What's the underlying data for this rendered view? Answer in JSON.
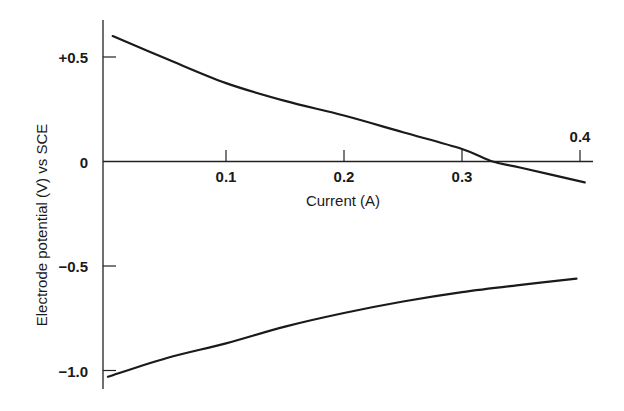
{
  "chart_data": {
    "type": "line",
    "title": "",
    "xlabel": "Current (A)",
    "ylabel": "Electrode potential (V) vs SCE",
    "xlim": [
      0,
      0.41
    ],
    "ylim": [
      -1.05,
      0.62
    ],
    "grid": false,
    "legend": null,
    "x_ticks": [
      {
        "value": 0.1,
        "label": "0.1"
      },
      {
        "value": 0.2,
        "label": "0.2"
      },
      {
        "value": 0.3,
        "label": "0.3"
      },
      {
        "value": 0.4,
        "label": "0.4"
      }
    ],
    "y_ticks": [
      {
        "value": 0.5,
        "label": "+0.5"
      },
      {
        "value": 0,
        "label": "0"
      },
      {
        "value": -0.5,
        "label": "-0.5"
      },
      {
        "value": -1.0,
        "label": "-1.0"
      }
    ],
    "series": [
      {
        "name": "upper curve",
        "x": [
          0.004,
          0.05,
          0.1,
          0.15,
          0.2,
          0.25,
          0.3,
          0.326,
          0.35,
          0.404
        ],
        "y": [
          0.6,
          0.49,
          0.375,
          0.29,
          0.22,
          0.14,
          0.06,
          0.0,
          -0.03,
          -0.1
        ]
      },
      {
        "name": "lower curve",
        "x": [
          0.0,
          0.05,
          0.1,
          0.15,
          0.2,
          0.25,
          0.3,
          0.35,
          0.397
        ],
        "y": [
          -1.03,
          -0.94,
          -0.87,
          -0.79,
          -0.725,
          -0.67,
          -0.625,
          -0.59,
          -0.56
        ]
      }
    ]
  }
}
